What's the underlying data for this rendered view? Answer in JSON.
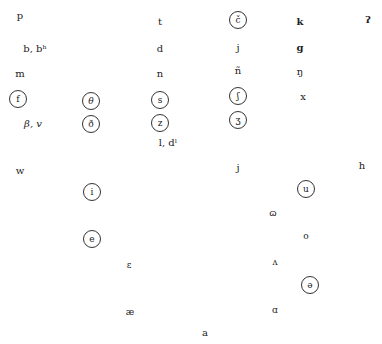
{
  "consonants": {
    "row1": {
      "p": "p",
      "t": "t",
      "c_hacek": "č",
      "k": "k",
      "glottal": "ʔ"
    },
    "row2": {
      "b": "b, bʰ",
      "d": "d",
      "j": "j",
      "g": "g"
    },
    "row3": {
      "m": "m",
      "n": "n",
      "n_tilde": "ñ",
      "eng": "ŋ"
    },
    "row4": {
      "f": "f",
      "theta": "θ",
      "s": "s",
      "esh": "ʃ",
      "x": "x"
    },
    "row5": {
      "beta_v": "β, v",
      "eth": "ð",
      "z": "z",
      "ezh": "ʒ"
    },
    "row6": {
      "l": "l, dˡ"
    },
    "glides": {
      "w": "w",
      "j": "j",
      "h": "h"
    }
  },
  "vowels": {
    "i": "i",
    "u": "u",
    "upsilon": "ɷ",
    "o": "o",
    "e": "e",
    "epsilon": "ɛ",
    "wedge": "ʌ",
    "schwa": "ə",
    "ash": "æ",
    "script_a": "ɑ",
    "a": "a"
  }
}
